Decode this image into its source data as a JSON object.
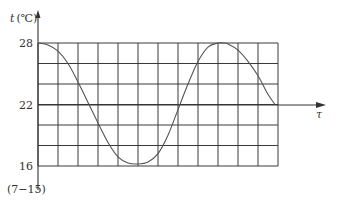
{
  "chart_data": {
    "type": "line",
    "title": "",
    "xlabel": "τ",
    "ylabel": "t (℃)",
    "y_unit_label": "t",
    "y_unit_suffix": "(℃)",
    "yticks": [
      16,
      22,
      28
    ],
    "ylim": [
      16,
      28
    ],
    "xlim": [
      0,
      12
    ],
    "grid": true,
    "grid_rows": 6,
    "grid_cols": 12,
    "annotation": "(7−15)",
    "series": [
      {
        "name": "temperature",
        "x": [
          0,
          0.5,
          1,
          1.5,
          2,
          2.5,
          3,
          3.5,
          4,
          4.5,
          5,
          5.5,
          6,
          6.5,
          7,
          7.5,
          8,
          8.5,
          9,
          9.25,
          9.5,
          10,
          10.5,
          11,
          11.5,
          11.85
        ],
        "values": [
          28,
          27.8,
          27.2,
          26.0,
          24.2,
          22.2,
          20.2,
          18.3,
          16.9,
          16.3,
          16.2,
          16.4,
          17.2,
          19.0,
          21.5,
          24.0,
          26.2,
          27.6,
          28.0,
          28.0,
          27.9,
          27.3,
          26.2,
          24.8,
          23.0,
          22.0
        ]
      }
    ]
  }
}
